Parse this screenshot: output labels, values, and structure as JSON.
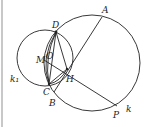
{
  "figure": {
    "labels": {
      "A": "A",
      "D": "D",
      "O": "O",
      "M": "M",
      "H": "H",
      "C": "C",
      "B": "B",
      "P": "P",
      "k": "k",
      "k1": "k₁"
    },
    "circles": [
      {
        "name": "k",
        "cx": 92,
        "cy": 63,
        "r": 48
      },
      {
        "name": "k1",
        "cx": 45,
        "cy": 58,
        "r": 28
      }
    ],
    "points": {
      "A": [
        102,
        17
      ],
      "D": [
        56,
        32
      ],
      "M": [
        44,
        60
      ],
      "H": [
        67,
        69
      ],
      "C": [
        49,
        84
      ],
      "B": [
        54,
        92
      ],
      "P": [
        117,
        106
      ]
    },
    "colors": {
      "stroke": "#222222",
      "edge": "#c8c8c8"
    }
  }
}
